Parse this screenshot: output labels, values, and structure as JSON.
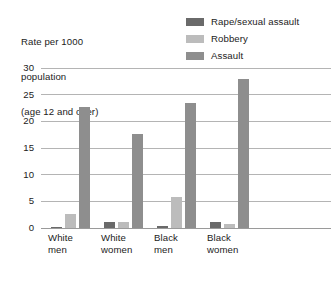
{
  "chart_data": {
    "type": "bar",
    "title": "",
    "subtitle": "",
    "xlabel": "",
    "ylabel": "Rate per 1000 population (age 12 and over)",
    "ylabel_lines": [
      "Rate per 1000",
      "population",
      "(age 12 and over)"
    ],
    "ylim": [
      0,
      30
    ],
    "yticks": [
      0,
      5,
      10,
      15,
      20,
      25,
      30
    ],
    "ytick_labels": [
      "0",
      "5",
      "10",
      "15",
      "20",
      "25",
      "30"
    ],
    "grid": true,
    "legend_position": "top-right",
    "categories": [
      "White men",
      "White women",
      "Black men",
      "Black women"
    ],
    "category_lines": [
      [
        "White",
        "men"
      ],
      [
        "White",
        "women"
      ],
      [
        "Black",
        "men"
      ],
      [
        "Black",
        "women"
      ]
    ],
    "series": [
      {
        "name": "Rape/sexual assault",
        "color": "#6a6a6a",
        "values": [
          0.2,
          1.1,
          0.4,
          1.2
        ]
      },
      {
        "name": "Robbery",
        "color": "#bcbcbc",
        "values": [
          2.7,
          1.1,
          5.8,
          0.8
        ]
      },
      {
        "name": "Assault",
        "color": "#8e8e8e",
        "values": [
          22.7,
          17.6,
          23.4,
          28.0
        ]
      }
    ]
  },
  "colors": {
    "gridline": "#b4b4b4",
    "baseline": "#9a9a9a",
    "text": "#1b1b1b",
    "background": "#ffffff"
  }
}
